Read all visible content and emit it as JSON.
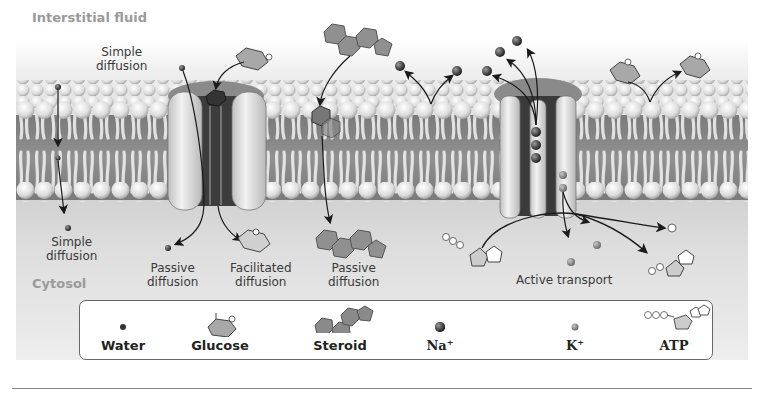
{
  "regions": {
    "top": "Interstitial fluid",
    "bottom": "Cytosol"
  },
  "labels": {
    "simple_diffusion_top": [
      "Simple",
      "diffusion"
    ],
    "simple_diffusion_bottom": [
      "Simple",
      "diffusion"
    ],
    "passive_diffusion_channel": [
      "Passive",
      "diffusion"
    ],
    "facilitated_diffusion": [
      "Facilitated",
      "diffusion"
    ],
    "passive_diffusion_steroid": [
      "Passive",
      "diffusion"
    ],
    "active_transport": "Active transport"
  },
  "legend": {
    "items": [
      {
        "label": "Water",
        "icon": "water-molecule-icon"
      },
      {
        "label": "Glucose",
        "icon": "glucose-molecule-icon"
      },
      {
        "label": "Steroid",
        "icon": "steroid-molecule-icon"
      },
      {
        "label": "Na",
        "superscript": "+",
        "icon": "sodium-ion-icon"
      },
      {
        "label": "K",
        "superscript": "+",
        "icon": "potassium-ion-icon"
      },
      {
        "label": "ATP",
        "icon": "atp-molecule-icon"
      }
    ]
  },
  "colors": {
    "membrane_core": "#8c8c8c",
    "lipid_head": "#e6e6e6",
    "channel_protein": "#d8d8d8",
    "channel_dark": "#3c3c3c",
    "molecule_fill": "#9a9a9a",
    "ion_dark": "#3a3a3a",
    "arrow": "#1a1a1a"
  }
}
